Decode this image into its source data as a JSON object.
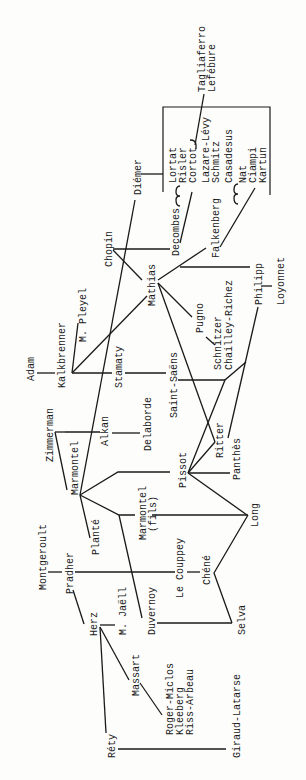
{
  "diagram": {
    "orientation": "rotated 90 degrees counter-clockwise",
    "type": "teacher-pupil lineage tree",
    "nodes": {
      "tagliaferro": "Tagliaferro",
      "lefebure": "Lefébure",
      "lortat": "Lortat",
      "risler": "Risler",
      "cortot": "Cortot",
      "lazare_levy": "Lazare-Lévy",
      "schmitz": "Schmitz",
      "casadesus": "Casadesus",
      "nat": "Nat",
      "ciampi": "Ciampi",
      "kartun": "Kartun",
      "diemer": "Diémer",
      "decombes": "Decombes",
      "falkenberg": "Falkenberg",
      "chopin": "Chopin",
      "mathias": "Mathias",
      "philipp": "Philipp",
      "loyonnet": "Loyonnet",
      "pugno": "Pugno",
      "schnitzer": "Schnitzer",
      "chailley_richez": "Chailley-Richez",
      "adam": "Adam",
      "kalkbrenner": "Kalkbrenner",
      "m_pleyel": "M. Pleyel",
      "stamaty": "Stamaty",
      "saint_saens": "Saint-Saëns",
      "zimmerman": "Zimmerman",
      "marmontel": "Marmontel",
      "alkan": "Alkan",
      "delaborde": "Delaborde",
      "ritter": "Ritter",
      "pissot": "Pissot",
      "panthes": "Panthès",
      "montgeroult": "Montgeroult",
      "plante": "Planté",
      "marmontel_fils": "Marmontel",
      "fils": "(fils)",
      "long": "Long",
      "pradher": "Pradher",
      "le_couppey": "Le Couppey",
      "chene": "Chéné",
      "m_jaell": "M. Jaëll",
      "duvernoy": "Duvernoy",
      "herz": "Herz",
      "selva": "Selva",
      "massart": "Massart",
      "roger_miclos": "Roger-Miclos",
      "kleeberg": "Kleeberg",
      "riss_arbeau": "Riss-Arbeau",
      "rety": "Réty",
      "giraud_latarse": "Giraud-Latarse"
    }
  }
}
